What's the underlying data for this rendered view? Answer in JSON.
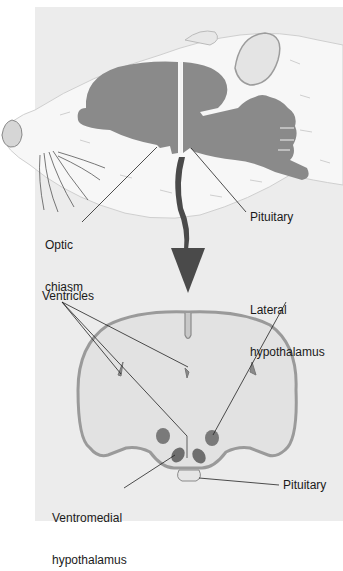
{
  "figure": {
    "type": "anatomical-diagram",
    "top_panel": {
      "subject": "rat head, sagittal view with brain exposed",
      "labels": {
        "optic_chiasm_line1": "Optic",
        "optic_chiasm_line2": "chiasm",
        "pituitary": "Pituitary"
      }
    },
    "arrow": {
      "direction": "down",
      "color": "#4a4a4a"
    },
    "bottom_panel": {
      "subject": "coronal brain section",
      "labels": {
        "ventricles": "Ventricles",
        "lateral_hypothalamus_line1": "Lateral",
        "lateral_hypothalamus_line2": "hypothalamus",
        "ventromedial_line1": "Ventromedial",
        "ventromedial_line2": "hypothalamus",
        "pituitary": "Pituitary"
      }
    },
    "colors": {
      "background": "#ececec",
      "brain_fill": "#8a8a8a",
      "section_fill": "#e2e2e2",
      "section_outline": "#9a9a9a",
      "nucleus_fill": "#7a7a7a",
      "leader_line": "#222222"
    }
  }
}
